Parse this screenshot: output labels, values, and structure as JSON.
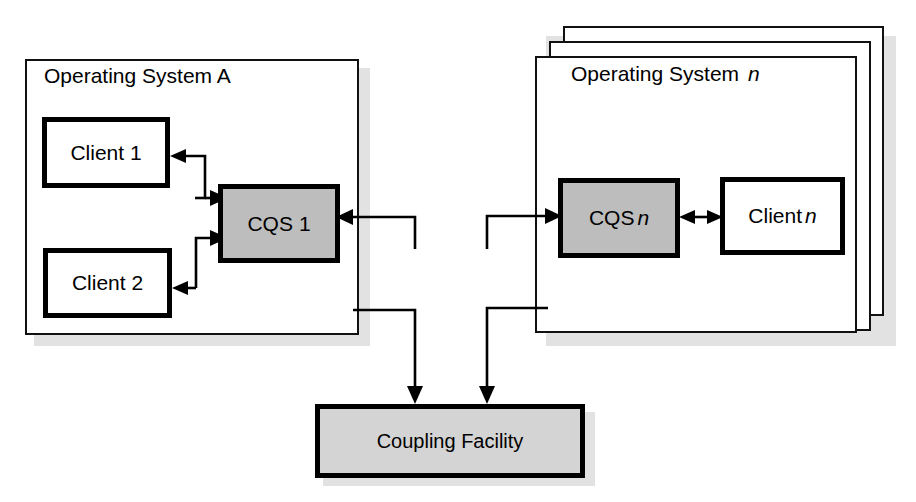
{
  "diagram": {
    "title_visible": false,
    "colors": {
      "cqs_fill": "#bdbdbd",
      "coupling_facility_fill": "#d4d4d4",
      "client_fill": "#ffffff",
      "os_fill": "#ffffff",
      "outline": "#000000",
      "shadow": "#e2e2e2"
    },
    "left_system": {
      "label_prefix": "Operating System",
      "label_suffix": "A",
      "clients": [
        {
          "label": "Client 1"
        },
        {
          "label": "Client 2"
        }
      ],
      "cqs": {
        "label_prefix": "CQS",
        "label_suffix": "1"
      }
    },
    "right_system": {
      "label_prefix": "Operating System",
      "label_suffix": "n",
      "label_suffix_italic": true,
      "stack_layers": 3,
      "clients": [
        {
          "label_prefix": "Client",
          "label_suffix": "n",
          "label_suffix_italic": true
        }
      ],
      "cqs": {
        "label_prefix": "CQS",
        "label_suffix": "n",
        "label_suffix_italic": true
      }
    },
    "coupling_facility": {
      "label": "Coupling Facility"
    },
    "connections": [
      {
        "from": "cqs-1",
        "to": "client-1",
        "direction": "one-way"
      },
      {
        "from": "client-1",
        "to": "cqs-1",
        "direction": "one-way"
      },
      {
        "from": "client-2",
        "to": "cqs-1",
        "direction": "one-way"
      },
      {
        "from": "cqs-1",
        "to": "client-2",
        "direction": "one-way"
      },
      {
        "from": "cqs-n",
        "to": "client-n",
        "direction": "two-way"
      },
      {
        "from": "coupling-facility",
        "to": "cqs-1",
        "direction": "one-way"
      },
      {
        "from": "cqs-1",
        "to": "coupling-facility",
        "direction": "one-way"
      },
      {
        "from": "coupling-facility",
        "to": "cqs-n",
        "direction": "one-way"
      },
      {
        "from": "cqs-n",
        "to": "coupling-facility",
        "direction": "one-way"
      }
    ]
  }
}
